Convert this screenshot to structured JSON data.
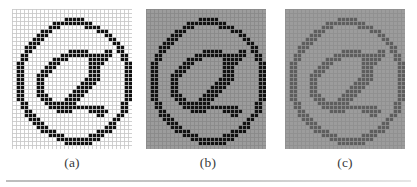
{
  "figure": {
    "background_color": "#ffffff",
    "divider_color": "#c2c2c2"
  },
  "panels": [
    {
      "id": "panel-a",
      "caption": "(a)",
      "x": 12,
      "y": 0,
      "cell_size": 4,
      "cols": 30,
      "rows": 35,
      "background_color": "#ffffff",
      "foreground_color": "#111111",
      "grid_color": "#c8c8c8",
      "description": "binary at-sign, black glyph on white background"
    },
    {
      "id": "panel-b",
      "caption": "(b)",
      "x": 146,
      "y": 0,
      "cell_size": 4,
      "cols": 30,
      "rows": 35,
      "background_color": "#9c9c9c",
      "foreground_color": "#111111",
      "grid_color": "#8a8a8a",
      "description": "at-sign, black glyph on mid-gray background"
    },
    {
      "id": "panel-c",
      "caption": "(c)",
      "x": 285,
      "y": 0,
      "cell_size": 4,
      "cols": 30,
      "rows": 35,
      "background_color": "#9c9c9c",
      "foreground_color": "#5e5e5e",
      "grid_color": "#8f8f8f",
      "description": "at-sign, low-contrast dark-gray glyph on mid-gray background"
    }
  ],
  "captions": [
    {
      "label": "(a)",
      "center_x": 72
    },
    {
      "label": "(b)",
      "center_x": 208
    },
    {
      "label": "(c)",
      "center_x": 345
    }
  ],
  "glyph_bitmap": {
    "cols": 30,
    "rows": 35,
    "note": "1 = foreground (glyph ink), 0 = background. Same bitmap used in all three panels.",
    "rows_data": [
      "000000000000000000000000000000",
      "000000000000000000000000000000",
      "000000000000011111000000000000",
      "000000000011111111110000000000",
      "000000000111000000111100000000",
      "000000011100000000000111000000",
      "000000111000000000000001100000",
      "000001110000000000000000110000",
      "000011100000000000000000011000",
      "000111000000000000000000001100",
      "000110000000001111100001101100",
      "001100000000111111111111100110",
      "001100000011110000011111000110",
      "011000000111000000011110000011",
      "011000001110000000011100000011",
      "011000011100000000011100000011",
      "011000111000000000011100000011",
      "011000110000000000111100000011",
      "011000110000000001111000000011",
      "011000110000000011110000000011",
      "011000110000000111100000000011",
      "011000111000001111000000000011",
      "011000011100011110000000000011",
      "001100001111111100000000000110",
      "001100000111111111111110000110",
      "000110000001111000011111000110",
      "000111000000000000000110001100",
      "000011100000000000000000011000",
      "000001110000000000000000110000",
      "000000111000000000000001110000",
      "000000011110000000000111100000",
      "000000000111100000011110000000",
      "000000000001111111111100000000",
      "000000000000011111110000000000",
      "000000000000000000000000000000"
    ]
  }
}
